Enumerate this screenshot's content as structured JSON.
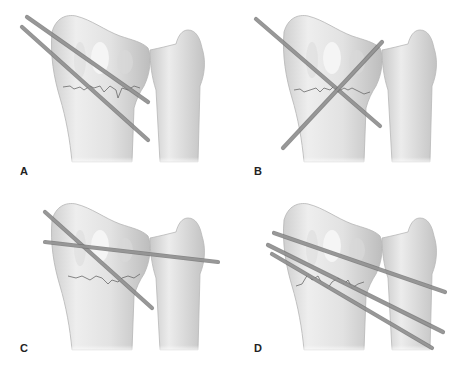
{
  "figure": {
    "colors": {
      "background": "#ffffff",
      "bone_fill": "#e6e6e6",
      "bone_shadow": "#c4c4c4",
      "bone_outline": "#b5b5b5",
      "pin_fill": "#9a9a9a",
      "pin_outline": "#6e6e6e",
      "fracture_line": "#6a6a6a",
      "label": "#222222"
    },
    "panels": [
      {
        "id": "A",
        "label": "A",
        "configuration": "Two parallel oblique pins from radial styloid crossing fracture",
        "pins": [
          {
            "x1": 27,
            "y1": 17,
            "x2": 148,
            "y2": 102
          },
          {
            "x1": 22,
            "y1": 27,
            "x2": 148,
            "y2": 140
          }
        ]
      },
      {
        "id": "B",
        "label": "B",
        "configuration": "Two crossed pins (radial styloid and dorsoulnar) crossing above fracture",
        "pins": [
          {
            "x1": 256,
            "y1": 19,
            "x2": 380,
            "y2": 126
          },
          {
            "x1": 382,
            "y1": 42,
            "x2": 283,
            "y2": 148
          }
        ]
      },
      {
        "id": "C",
        "label": "C",
        "configuration": "One oblique radial styloid pin plus one transverse pin through radius into ulna",
        "pins": [
          {
            "x1": 45,
            "y1": 212,
            "x2": 152,
            "y2": 308
          },
          {
            "x1": 45,
            "y1": 242,
            "x2": 218,
            "y2": 262
          }
        ]
      },
      {
        "id": "D",
        "label": "D",
        "configuration": "Three pins transfixing radius into ulna",
        "pins": [
          {
            "x1": 274,
            "y1": 233,
            "x2": 445,
            "y2": 292
          },
          {
            "x1": 268,
            "y1": 245,
            "x2": 443,
            "y2": 332
          },
          {
            "x1": 272,
            "y1": 254,
            "x2": 432,
            "y2": 348
          }
        ]
      }
    ]
  }
}
